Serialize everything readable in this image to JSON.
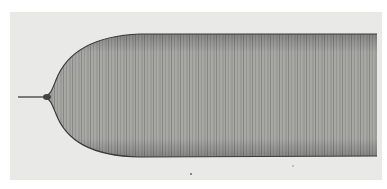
{
  "figure": {
    "colors": {
      "background": "#ffffff",
      "paper": "#e9e9e7",
      "band_fill": "#a9a9a6",
      "band_edge": "#3a3a3a",
      "stem": "#555555"
    }
  }
}
